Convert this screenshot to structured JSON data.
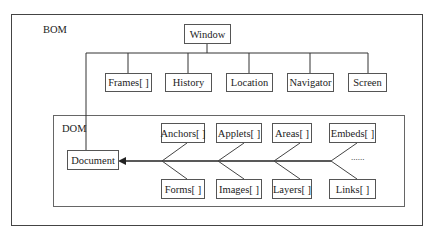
{
  "bom": {
    "label": "BOM",
    "root": "Window",
    "children": [
      "Frames[ ]",
      "History",
      "Location",
      "Navigator",
      "Screen"
    ]
  },
  "dom": {
    "label": "DOM",
    "root": "Document",
    "top_row": [
      "Anchors[ ]",
      "Applets[ ]",
      "Areas[ ]",
      "Embeds[ ]"
    ],
    "bottom_row": [
      "Forms[ ]",
      "Images[ ]",
      "Layers[ ]",
      "Links[ ]"
    ],
    "ellipsis": "......"
  }
}
